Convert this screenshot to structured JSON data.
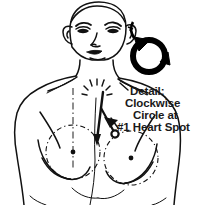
{
  "figure": {
    "title": "Clockwise Circle at #1 Heart Spot",
    "background_color": "#ffffff",
    "ink_color": "#000000",
    "caption": {
      "lines": [
        "Detail:",
        "Clockwise",
        "Circle at",
        "#1 Heart Spot"
      ],
      "line_0": "Detail:",
      "line_1": "Clockwise",
      "line_2": "Circle at",
      "line_3": "#1 Heart Spot"
    },
    "annotations": {
      "detail_circle": {
        "name": "clockwise-circle-detail",
        "shape": "thick ring with two arrowheads indicating clockwise rotation",
        "center_x": 150,
        "center_y": 55,
        "radius": 17,
        "stroke_width": 6,
        "color": "#000000"
      },
      "pointer_arrow": {
        "name": "pointer-arrow-to-heart-spot",
        "description": "vertical stem with branching arrow pointing down-right to the heart spot marker",
        "color": "#000000"
      },
      "heart_spot_marker": {
        "name": "heart-spot-marker",
        "description": "small open circle marking the #1 Heart Spot on the chest",
        "center_x": 114,
        "center_y": 134,
        "radius": 3.4
      },
      "dashed_breast_circle_left": {
        "name": "dashed-guide-circle-left",
        "center_x": 63,
        "center_y": 155,
        "radius": 25,
        "style": "dash-dot"
      },
      "dashed_breast_circle_right": {
        "name": "dashed-guide-circle-right",
        "center_x": 129,
        "center_y": 160,
        "radius": 25,
        "style": "dash-dot"
      },
      "sternum_guide_line": {
        "name": "sternum-centerline",
        "style": "dash-dot vertical"
      },
      "clavicle_notch_marks": {
        "name": "suprasternal-notch-marks",
        "style": "short dashes"
      }
    }
  }
}
